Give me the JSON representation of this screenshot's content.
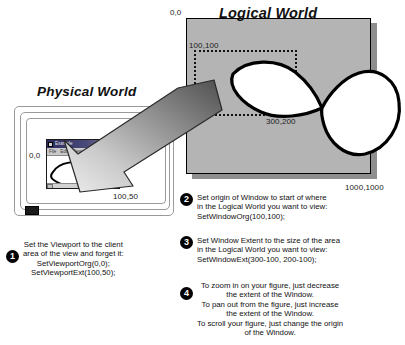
{
  "diagram": {
    "physical_world": {
      "title": "Physical World",
      "origin_label": "0,0",
      "extent_label": "100,50",
      "app_window": {
        "title": "Example",
        "menu_items": [
          "File",
          "Edit",
          "View"
        ],
        "sysmenu_icon": "system-menu-icon",
        "minimize_icon": "minimize-icon",
        "maximize_icon": "maximize-icon",
        "scroll_left_icon": "scroll-left-arrow-icon",
        "scroll_right_icon": "scroll-right-arrow-icon"
      },
      "mouse_icon": "mouse-icon"
    },
    "logical_world": {
      "title": "Logical World",
      "origin_label": "0,0",
      "extent_label": "1000,1000",
      "window_origin_label": "100,100",
      "window_extent_label": "300,200"
    },
    "arrow_icon": "mapping-arrow-icon"
  },
  "steps": [
    {
      "number": "1",
      "text": "Set the Viewport to the client\narea of the view and forget it:\nSetViewportOrg(0,0);\nSetViewportExt(100,50);"
    },
    {
      "number": "2",
      "text": "Set origin of Window to start of where\nin the Logical World you want to view:\nSetWindowOrg(100,100);"
    },
    {
      "number": "3",
      "text": "Set Window Extent to the size of the area\nin the Logical World you want to view:\nSetWindowExt(300-100, 200-100);"
    },
    {
      "number": "4",
      "text": "To zoom in on your figure, just decrease\nthe extent of the Window.\nTo pan out from the figure, just increase\nthe extent of the Window.\nTo scroll your figure, just change the origin\nof the Window."
    }
  ],
  "colors": {
    "logical_world_fill": "#b4b4b4",
    "logical_world_shadow": "#8e8e8e",
    "outline": "#000000",
    "titlebar_start": "#2b2b5e",
    "arrow_dark": "#5a5a5a",
    "arrow_light": "#e3e3e3"
  }
}
